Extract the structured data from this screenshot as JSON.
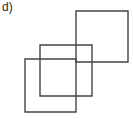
{
  "figure": {
    "panel_label": "d)",
    "canvas": {
      "width": 133,
      "height": 119,
      "background": "#ffffff"
    },
    "stroke_color": "#444444",
    "stroke_width": 1.4,
    "label_color": "#2b2b2b",
    "shapes": [
      {
        "name": "square-top-right",
        "x": 76,
        "y": 11,
        "width": 52,
        "height": 51
      },
      {
        "name": "square-middle",
        "x": 40,
        "y": 45,
        "width": 52,
        "height": 51
      },
      {
        "name": "square-bottom-left",
        "x": 25,
        "y": 59,
        "width": 51,
        "height": 53
      }
    ],
    "visible_segments": [
      {
        "name": "seg-a-top",
        "x1": 76,
        "y1": 11,
        "x2": 128,
        "y2": 11
      },
      {
        "name": "seg-a-right",
        "x1": 128,
        "y1": 11,
        "x2": 128,
        "y2": 62
      },
      {
        "name": "seg-a-bottom",
        "x1": 40,
        "y1": 62,
        "x2": 128,
        "y2": 62
      },
      {
        "name": "seg-a-left",
        "x1": 76,
        "y1": 11,
        "x2": 76,
        "y2": 112
      },
      {
        "name": "seg-b-top",
        "x1": 40,
        "y1": 45,
        "x2": 128,
        "y2": 45
      },
      {
        "name": "seg-b-left",
        "x1": 40,
        "y1": 45,
        "x2": 40,
        "y2": 112
      },
      {
        "name": "seg-c-top",
        "x1": 25,
        "y1": 59,
        "x2": 76,
        "y2": 59
      },
      {
        "name": "seg-c-left",
        "x1": 25,
        "y1": 59,
        "x2": 25,
        "y2": 112
      },
      {
        "name": "seg-c-bottom",
        "x1": 25,
        "y1": 112,
        "x2": 76,
        "y2": 112
      }
    ]
  }
}
